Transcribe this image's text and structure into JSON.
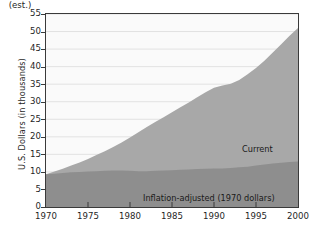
{
  "chart_data": {
    "type": "area",
    "title": "",
    "subtitle": "",
    "xlabel": "",
    "ylabel": "U.S. Dollars (in thousands)",
    "xlim": [
      1970,
      2000
    ],
    "ylim": [
      0,
      55
    ],
    "grid": true,
    "grid_axis": "y",
    "legend_position": "inline-annotations",
    "stacked": false,
    "x": [
      1970,
      1971,
      1972,
      1973,
      1974,
      1975,
      1976,
      1977,
      1978,
      1979,
      1980,
      1981,
      1982,
      1983,
      1984,
      1985,
      1986,
      1987,
      1988,
      1989,
      1990,
      1991,
      1992,
      1993,
      1994,
      1995,
      1996,
      1997,
      1998,
      1999,
      2000
    ],
    "xtick_labels": [
      "1970",
      "1975",
      "1980",
      "1985",
      "1990",
      "1995",
      "2000"
    ],
    "xtick_values": [
      1970,
      1975,
      1980,
      1985,
      1990,
      1995,
      2000
    ],
    "xtick_note": "(est.)",
    "xtick_note_at": 2000,
    "ytick_labels": [
      "0",
      "5",
      "10",
      "15",
      "20",
      "25",
      "30",
      "35",
      "40",
      "45",
      "50",
      "55"
    ],
    "ytick_values": [
      0,
      5,
      10,
      15,
      20,
      25,
      30,
      35,
      40,
      45,
      50,
      55
    ],
    "series": [
      {
        "name": "Current",
        "label": "Current",
        "color": "#a8a8a8",
        "values": [
          9.3,
          10.1,
          10.9,
          11.8,
          12.7,
          13.7,
          14.8,
          15.9,
          17.1,
          18.4,
          19.8,
          21.3,
          22.8,
          24.2,
          25.6,
          27.0,
          28.4,
          29.8,
          31.3,
          32.7,
          34.0,
          34.6,
          35.1,
          36.2,
          37.8,
          39.6,
          41.7,
          44.0,
          46.4,
          48.8,
          51.0
        ]
      },
      {
        "name": "Inflation-adjusted (1970 dollars)",
        "label": "Inflation-adjusted (1970 dollars)",
        "color": "#8e8e8e",
        "values": [
          9.3,
          9.5,
          9.7,
          9.9,
          10.0,
          10.1,
          10.2,
          10.3,
          10.4,
          10.4,
          10.3,
          10.2,
          10.2,
          10.3,
          10.4,
          10.5,
          10.6,
          10.7,
          10.8,
          10.9,
          11.0,
          11.0,
          11.1,
          11.3,
          11.5,
          11.8,
          12.1,
          12.4,
          12.6,
          12.8,
          13.0
        ]
      }
    ],
    "annotations": [
      {
        "text": "Current",
        "x": 1989,
        "y": 23
      },
      {
        "text": "Inflation-adjusted (1970 dollars)",
        "x": 1982,
        "y": 5.5
      }
    ],
    "colors": {
      "plot_background": "#fafafa",
      "grid": "#e2e2e2",
      "axis": "#3a3a3a",
      "current_fill": "#a8a8a8",
      "inflation_fill": "#8e8e8e",
      "text": "#1a1a1a",
      "page_background": "#ffffff"
    }
  }
}
